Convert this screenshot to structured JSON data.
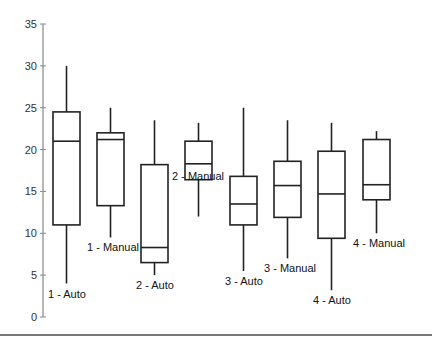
{
  "chart_data": {
    "type": "boxplot",
    "title": "",
    "xlabel": "",
    "ylabel": "",
    "ylim": [
      0,
      35
    ],
    "yticks": [
      0,
      5,
      10,
      15,
      20,
      25,
      30,
      35
    ],
    "grid": false,
    "legend": null,
    "categories": [
      "1 - Auto",
      "1 - Manual",
      "2 - Auto",
      "2 - Manual",
      "3 - Auto",
      "3 - Manual",
      "4 - Auto",
      "4 - Manual"
    ],
    "boxes": [
      {
        "label": "1 - Auto",
        "min": 4.0,
        "q1": 11.0,
        "median": 21.0,
        "q3": 24.5,
        "max": 30.0
      },
      {
        "label": "1 - Manual",
        "min": 9.5,
        "q1": 13.3,
        "median": 21.2,
        "q3": 22.0,
        "max": 25.0
      },
      {
        "label": "2 - Auto",
        "min": 5.0,
        "q1": 6.5,
        "median": 8.3,
        "q3": 18.2,
        "max": 23.5
      },
      {
        "label": "2 - Manual",
        "min": 12.0,
        "q1": 16.4,
        "median": 18.3,
        "q3": 21.0,
        "max": 23.2
      },
      {
        "label": "3 - Auto",
        "min": 5.5,
        "q1": 11.0,
        "median": 13.5,
        "q3": 16.8,
        "max": 25.0
      },
      {
        "label": "3 - Manual",
        "min": 7.0,
        "q1": 11.9,
        "median": 15.7,
        "q3": 18.6,
        "max": 23.5
      },
      {
        "label": "4 - Auto",
        "min": 3.2,
        "q1": 9.4,
        "median": 14.7,
        "q3": 19.8,
        "max": 23.2
      },
      {
        "label": "4 - Manual",
        "min": 10.0,
        "q1": 14.0,
        "median": 15.8,
        "q3": 21.2,
        "max": 22.2
      }
    ]
  }
}
